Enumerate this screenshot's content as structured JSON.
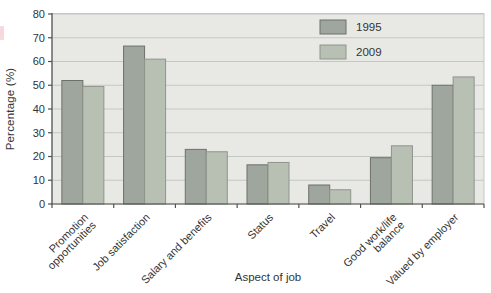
{
  "chart_data": {
    "type": "bar",
    "title": "",
    "xlabel": "Aspect of job",
    "ylabel": "Percentage (%)",
    "ylim": [
      0,
      80
    ],
    "ytick_step": 10,
    "grid": true,
    "legend_position": "top-right-inside",
    "categories": [
      "Promotion\nopportunities",
      "Job satisfaction",
      "Salary and benefits",
      "Status",
      "Travel",
      "Good work/life\nbalance",
      "Valued by employer"
    ],
    "series": [
      {
        "name": "1995",
        "color": "#9ea69d",
        "border_color": "#6d716c",
        "values": [
          52,
          66.5,
          23,
          16.5,
          8,
          19.5,
          50
        ]
      },
      {
        "name": "2009",
        "color": "#b8bfb3",
        "border_color": "#8f948c",
        "values": [
          49.5,
          61,
          22,
          17.5,
          6,
          24.5,
          53.5
        ]
      }
    ],
    "colors": {
      "plot_bg": "#e8e9e5",
      "grid": "#c5c7c2",
      "axis": "#50524d",
      "text": "#333333",
      "page_bg": "#ffffff",
      "artifact_pink": "#f5c9d2"
    }
  }
}
